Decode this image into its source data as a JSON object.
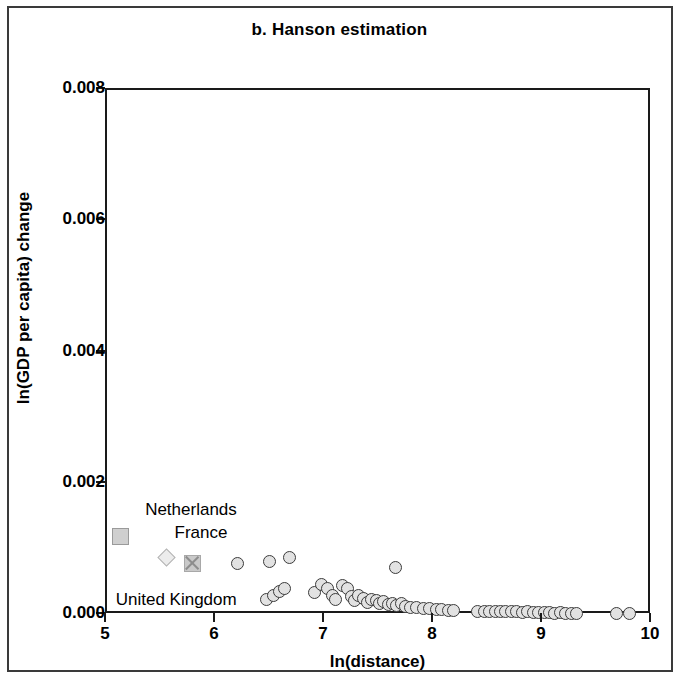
{
  "figure": {
    "title": "b. Hanson estimation",
    "border_color": "#3a3a3a"
  },
  "chart_data": {
    "type": "scatter",
    "title": "b. Hanson estimation",
    "xlabel": "ln(distance)",
    "ylabel": "ln(GDP per capita) change",
    "xlim": [
      5,
      10
    ],
    "ylim": [
      0.0,
      0.008
    ],
    "xticks": [
      "5",
      "6",
      "7",
      "8",
      "9",
      "10"
    ],
    "xtick_values": [
      5,
      6,
      7,
      8,
      9,
      10
    ],
    "yticks": [
      "0.000",
      "0.002",
      "0.004",
      "0.006",
      "0.008"
    ],
    "ytick_values": [
      0.0,
      0.002,
      0.004,
      0.006,
      0.008
    ],
    "grid": false,
    "legend": "none",
    "marker_style": {
      "shape": "circle",
      "fill": "#e2e2e2",
      "edge": "#3b3b3b",
      "size": 13
    },
    "annotations": [
      {
        "text": "Netherlands",
        "x": 5.35,
        "y": 0.00158,
        "marker": "square",
        "marker_x": 5.12,
        "marker_y": 0.0012
      },
      {
        "text": "France",
        "x": 5.62,
        "y": 0.00123,
        "marker": "diamond",
        "marker_x": 5.56,
        "marker_y": 0.00084
      },
      {
        "text": "United Kingdom",
        "x": 5.08,
        "y": 0.00022,
        "marker": "x-square",
        "marker_x": 5.78,
        "marker_y": 0.00078
      }
    ],
    "series": [
      {
        "name": "countries",
        "points": [
          [
            6.2,
            0.00078
          ],
          [
            6.49,
            0.00081
          ],
          [
            6.67,
            0.00088
          ],
          [
            7.65,
            0.00073
          ],
          [
            6.46,
            0.00023
          ],
          [
            6.53,
            0.0003
          ],
          [
            6.58,
            0.00036
          ],
          [
            6.63,
            0.00041
          ],
          [
            6.9,
            0.00035
          ],
          [
            6.97,
            0.00047
          ],
          [
            7.02,
            0.00041
          ],
          [
            7.07,
            0.0003
          ],
          [
            7.1,
            0.00024
          ],
          [
            7.16,
            0.00045
          ],
          [
            7.21,
            0.0004
          ],
          [
            7.24,
            0.00028
          ],
          [
            7.27,
            0.00022
          ],
          [
            7.31,
            0.0003
          ],
          [
            7.35,
            0.00025
          ],
          [
            7.39,
            0.00019
          ],
          [
            7.43,
            0.00024
          ],
          [
            7.47,
            0.00022
          ],
          [
            7.5,
            0.00018
          ],
          [
            7.54,
            0.00021
          ],
          [
            7.58,
            0.00016
          ],
          [
            7.62,
            0.00018
          ],
          [
            7.66,
            0.00014
          ],
          [
            7.7,
            0.00017
          ],
          [
            7.74,
            0.00013
          ],
          [
            7.78,
            0.00011
          ],
          [
            7.84,
            0.00012
          ],
          [
            7.9,
            0.0001
          ],
          [
            7.96,
            0.0001
          ],
          [
            8.02,
            8e-05
          ],
          [
            8.07,
            9e-05
          ],
          [
            8.13,
            7e-05
          ],
          [
            8.18,
            7e-05
          ],
          [
            8.4,
            6e-05
          ],
          [
            8.46,
            6e-05
          ],
          [
            8.51,
            5e-05
          ],
          [
            8.56,
            6e-05
          ],
          [
            8.61,
            5e-05
          ],
          [
            8.66,
            5e-05
          ],
          [
            8.71,
            5e-05
          ],
          [
            8.76,
            5e-05
          ],
          [
            8.81,
            4e-05
          ],
          [
            8.86,
            5e-05
          ],
          [
            8.91,
            4e-05
          ],
          [
            8.96,
            4e-05
          ],
          [
            9.01,
            4e-05
          ],
          [
            9.06,
            4e-05
          ],
          [
            9.11,
            3e-05
          ],
          [
            9.16,
            4e-05
          ],
          [
            9.21,
            3e-05
          ],
          [
            9.26,
            3e-05
          ],
          [
            9.31,
            3e-05
          ],
          [
            9.67,
            2e-05
          ],
          [
            9.79,
            2e-05
          ]
        ]
      }
    ]
  }
}
